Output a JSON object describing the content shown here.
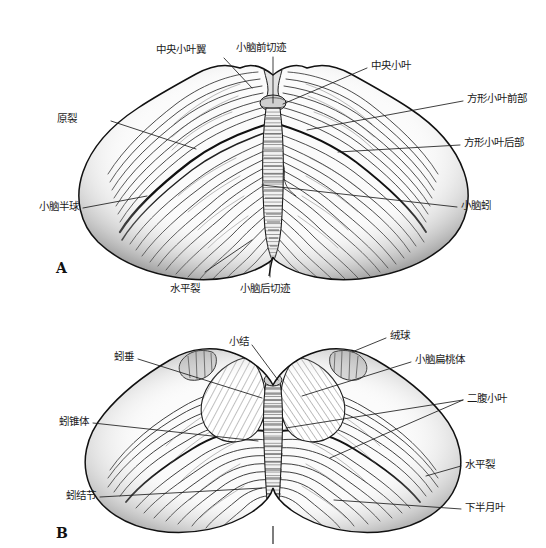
{
  "figure": {
    "panels": [
      {
        "id": "A",
        "letter": "A",
        "view": "小脑上面观",
        "labels": [
          {
            "key": "central_lobule_wing",
            "text": "中央小叶翼",
            "side": "left"
          },
          {
            "key": "anterior_cerebellar_notch",
            "text": "小脑前切迹",
            "side": "top"
          },
          {
            "key": "central_lobule",
            "text": "中央小叶",
            "side": "right"
          },
          {
            "key": "quadrangular_lobule_anterior",
            "text": "方形小叶前部",
            "side": "right"
          },
          {
            "key": "quadrangular_lobule_posterior",
            "text": "方形小叶后部",
            "side": "right"
          },
          {
            "key": "primary_fissure",
            "text": "原裂",
            "side": "left"
          },
          {
            "key": "cerebellar_hemisphere",
            "text": "小脑半球",
            "side": "left"
          },
          {
            "key": "vermis",
            "text": "小脑蚓",
            "side": "right"
          },
          {
            "key": "horizontal_fissure",
            "text": "水平裂",
            "side": "bottom"
          },
          {
            "key": "posterior_cerebellar_notch",
            "text": "小脑后切迹",
            "side": "bottom"
          }
        ]
      },
      {
        "id": "B",
        "letter": "B",
        "view": "小脑下面观",
        "labels": [
          {
            "key": "nodule",
            "text": "小结",
            "side": "top"
          },
          {
            "key": "flocculus",
            "text": "绒球",
            "side": "right"
          },
          {
            "key": "uvula",
            "text": "蚓垂",
            "side": "left"
          },
          {
            "key": "cerebellar_tonsil",
            "text": "小脑扁桃体",
            "side": "right"
          },
          {
            "key": "biventral_lobule",
            "text": "二腹小叶",
            "side": "right"
          },
          {
            "key": "pyramid_of_vermis",
            "text": "蚓锥体",
            "side": "left"
          },
          {
            "key": "horizontal_fissure_b",
            "text": "水平裂",
            "side": "right"
          },
          {
            "key": "tuber_of_vermis",
            "text": "蚓结节",
            "side": "left"
          },
          {
            "key": "inferior_semilunar_lobule",
            "text": "下半月叶",
            "side": "right"
          }
        ]
      }
    ],
    "colors": {
      "ink": "#1d1d1d",
      "label_text": "#1a1a1a",
      "background": "#ffffff",
      "shade_light": "#d8d8d8",
      "shade_mid": "#9a9a9a",
      "shade_dark": "#5a5a5a"
    }
  }
}
